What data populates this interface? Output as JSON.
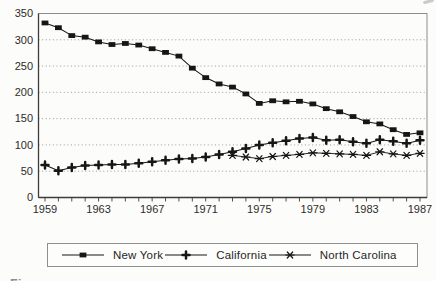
{
  "page": {
    "background": "#fcfcfa"
  },
  "chart_data": {
    "type": "line",
    "title": "",
    "x_start": 1959,
    "x_end": 1987,
    "x_tick_labels": [
      "1959",
      "1963",
      "1967",
      "1971",
      "1975",
      "1979",
      "1983",
      "1987"
    ],
    "y_tick_labels": [
      "0",
      "50",
      "100",
      "150",
      "200",
      "250",
      "300",
      "350"
    ],
    "y_tick_step": 50,
    "ylim": [
      0,
      350
    ],
    "grid": "horizontal-dotted-every-50",
    "legend_position": "boxed-below-plot",
    "line_color": "#161616",
    "axis_color": "#3c3c3c",
    "grid_color": "#8f8f8f",
    "series": [
      {
        "name": "New York",
        "marker": "filled-square",
        "start_year": 1959,
        "values": [
          332,
          323,
          308,
          305,
          296,
          291,
          293,
          290,
          283,
          276,
          269,
          246,
          228,
          216,
          210,
          197,
          179,
          184,
          182,
          183,
          178,
          169,
          163,
          154,
          144,
          140,
          129,
          120,
          123
        ]
      },
      {
        "name": "California",
        "marker": "bold-plus",
        "start_year": 1959,
        "values": [
          62,
          51,
          57,
          61,
          62,
          63,
          63,
          65,
          68,
          71,
          73,
          74,
          77,
          82,
          87,
          93,
          100,
          104,
          108,
          112,
          114,
          109,
          110,
          106,
          103,
          110,
          107,
          103,
          109
        ]
      },
      {
        "name": "North Carolina",
        "marker": "asterisk",
        "start_year": 1973,
        "values": [
          80,
          77,
          74,
          78,
          80,
          82,
          85,
          84,
          83,
          82,
          80,
          87,
          83,
          80,
          84
        ]
      }
    ],
    "caption_fragment": "Figure"
  }
}
